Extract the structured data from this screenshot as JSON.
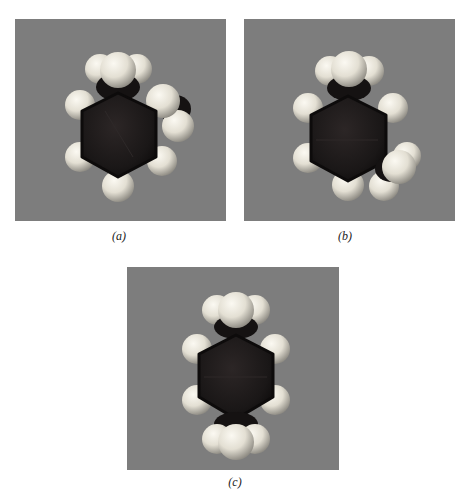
{
  "figure": {
    "panels": [
      {
        "id": "a",
        "caption": "(a)",
        "molecule": "ortho-xylene",
        "background": "#7d7d7d"
      },
      {
        "id": "b",
        "caption": "(b)",
        "molecule": "meta-xylene",
        "background": "#7d7d7d"
      },
      {
        "id": "c",
        "caption": "(c)",
        "molecule": "para-xylene",
        "background": "#7d7d7d"
      }
    ],
    "colors": {
      "carbon": "#1c1919",
      "hydrogen": "#e6e2d6",
      "hydrogen_shade": "#9c988e",
      "panel_bg": "#7d7d7d",
      "page_bg": "#ffffff"
    }
  }
}
